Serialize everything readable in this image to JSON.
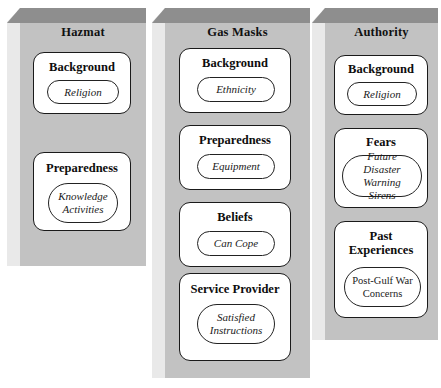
{
  "diagram": {
    "type": "three-column-nested-construct-diagram",
    "colors": {
      "column_face": "#c2c2c2",
      "column_top_bevel": "#8e8e8e",
      "column_left_side": "#e9e9e9",
      "box_fill": "#ffffff",
      "box_border": "#1a1a1a",
      "page_background": "#ffffff"
    },
    "columns": [
      {
        "id": "hazmat",
        "title": "Hazmat",
        "constructs": [
          {
            "label": "Background",
            "items": [
              {
                "text": "Religion",
                "style": "italic"
              }
            ]
          },
          {
            "label": "Preparedness",
            "items": [
              {
                "text": "Knowledge\nActivities",
                "style": "italic"
              }
            ]
          }
        ]
      },
      {
        "id": "gas-masks",
        "title": "Gas Masks",
        "constructs": [
          {
            "label": "Background",
            "items": [
              {
                "text": "Ethnicity",
                "style": "italic"
              }
            ]
          },
          {
            "label": "Preparedness",
            "items": [
              {
                "text": "Equipment",
                "style": "italic"
              }
            ]
          },
          {
            "label": "Beliefs",
            "items": [
              {
                "text": "Can Cope",
                "style": "italic"
              }
            ]
          },
          {
            "label": "Service Provider",
            "items": [
              {
                "text": "Satisfied\nInstructions",
                "style": "italic"
              }
            ]
          }
        ]
      },
      {
        "id": "authority",
        "title": "Authority",
        "constructs": [
          {
            "label": "Background",
            "items": [
              {
                "text": "Religion",
                "style": "italic"
              }
            ]
          },
          {
            "label": "Fears",
            "items": [
              {
                "text": "Future Disaster\nWarning Sirens",
                "style": "italic"
              }
            ]
          },
          {
            "label": "Past\nExperiences",
            "items": [
              {
                "text": "Post-Gulf War\nConcerns",
                "style": "upright"
              }
            ]
          }
        ]
      }
    ]
  }
}
